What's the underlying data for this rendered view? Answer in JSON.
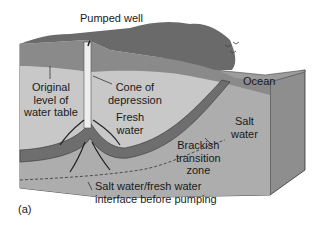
{
  "diagram": {
    "labels": {
      "well": "Pumped well",
      "original_line1": "Original",
      "original_line2": "level of",
      "original_line3": "water table",
      "cone_line1": "Cone of",
      "cone_line2": "depression",
      "fresh_line1": "Fresh",
      "fresh_line2": "water",
      "ocean": "Ocean",
      "salt_line1": "Salt",
      "salt_line2": "water",
      "brackish_line1": "Brackish",
      "brackish_line2": "transition",
      "brackish_line3": "zone",
      "interface_line1": "Salt water/fresh water",
      "interface_line2": "interface before pumping",
      "panel": "(a)"
    },
    "colors": {
      "soil_top": "#8c8c8c",
      "fresh_water": "#c2c2c2",
      "salt_water": "#a9a9a9",
      "front_face": "#b5b5b5",
      "side_face": "#8a8a8a",
      "brackish": "#6e6e6e",
      "ocean": "#9c9c9c",
      "vegetation": "#5a5a5a"
    }
  }
}
